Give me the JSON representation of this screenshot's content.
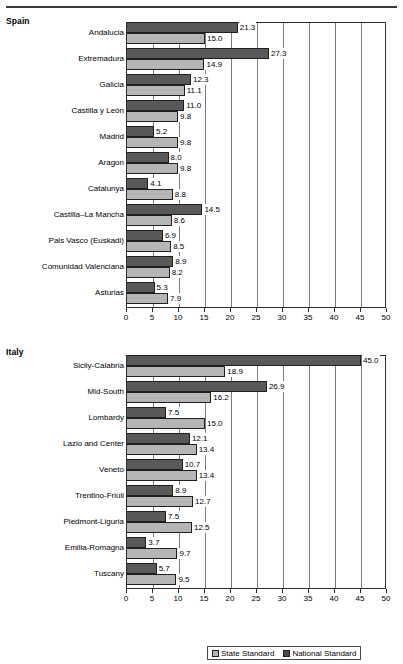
{
  "panels": {
    "spain": {
      "title": "Spain"
    },
    "italy": {
      "title": "Italy"
    }
  },
  "legend": {
    "items": [
      {
        "label": "State Standard",
        "color": "#b5b5b5",
        "key": "state"
      },
      {
        "label": "National Standard",
        "color": "#4a4a4a",
        "key": "national"
      }
    ]
  },
  "axis": {
    "ticks": [
      0,
      5,
      10,
      15,
      20,
      25,
      30,
      35,
      40,
      45,
      50
    ],
    "min": 0,
    "max": 50
  },
  "chart_data": [
    {
      "type": "bar",
      "title": "Spain",
      "orientation": "horizontal",
      "xlabel": "",
      "ylabel": "",
      "xlim": [
        0,
        50
      ],
      "grid": true,
      "legend_position": "bottom",
      "categories": [
        "Andalucia",
        "Extremadura",
        "Galicia",
        "Castilla y León",
        "Madrid",
        "Aragon",
        "Catalunya",
        "Castilla–La Mancha",
        "Pais Vasco (Euskadi)",
        "Comunidad Valenciana",
        "Asturias"
      ],
      "series": [
        {
          "name": "National Standard",
          "color": "#595959",
          "values": [
            21.3,
            27.3,
            12.3,
            11.0,
            5.2,
            8.0,
            4.1,
            14.5,
            6.9,
            8.9,
            5.3
          ]
        },
        {
          "name": "State Standard",
          "color": "#b5b5b5",
          "values": [
            15.0,
            14.9,
            11.1,
            9.8,
            9.8,
            9.8,
            8.8,
            8.6,
            8.5,
            8.2,
            7.9
          ]
        }
      ]
    },
    {
      "type": "bar",
      "title": "Italy",
      "orientation": "horizontal",
      "xlabel": "",
      "ylabel": "",
      "xlim": [
        0,
        50
      ],
      "grid": true,
      "legend_position": "bottom",
      "categories": [
        "Sicily-Calabria",
        "Mid-South",
        "Lombardy",
        "Lazio and Center",
        "Veneto",
        "Trentino-Friuli",
        "Piedmont-Liguria",
        "Emilia-Romagna",
        "Tuscany"
      ],
      "series": [
        {
          "name": "National Standard",
          "color": "#595959",
          "values": [
            45.0,
            26.9,
            7.5,
            12.1,
            10.7,
            8.9,
            7.5,
            3.7,
            5.7
          ]
        },
        {
          "name": "State Standard",
          "color": "#b5b5b5",
          "values": [
            18.9,
            16.2,
            15.0,
            13.4,
            13.4,
            12.7,
            12.5,
            9.7,
            9.5
          ]
        }
      ]
    }
  ]
}
